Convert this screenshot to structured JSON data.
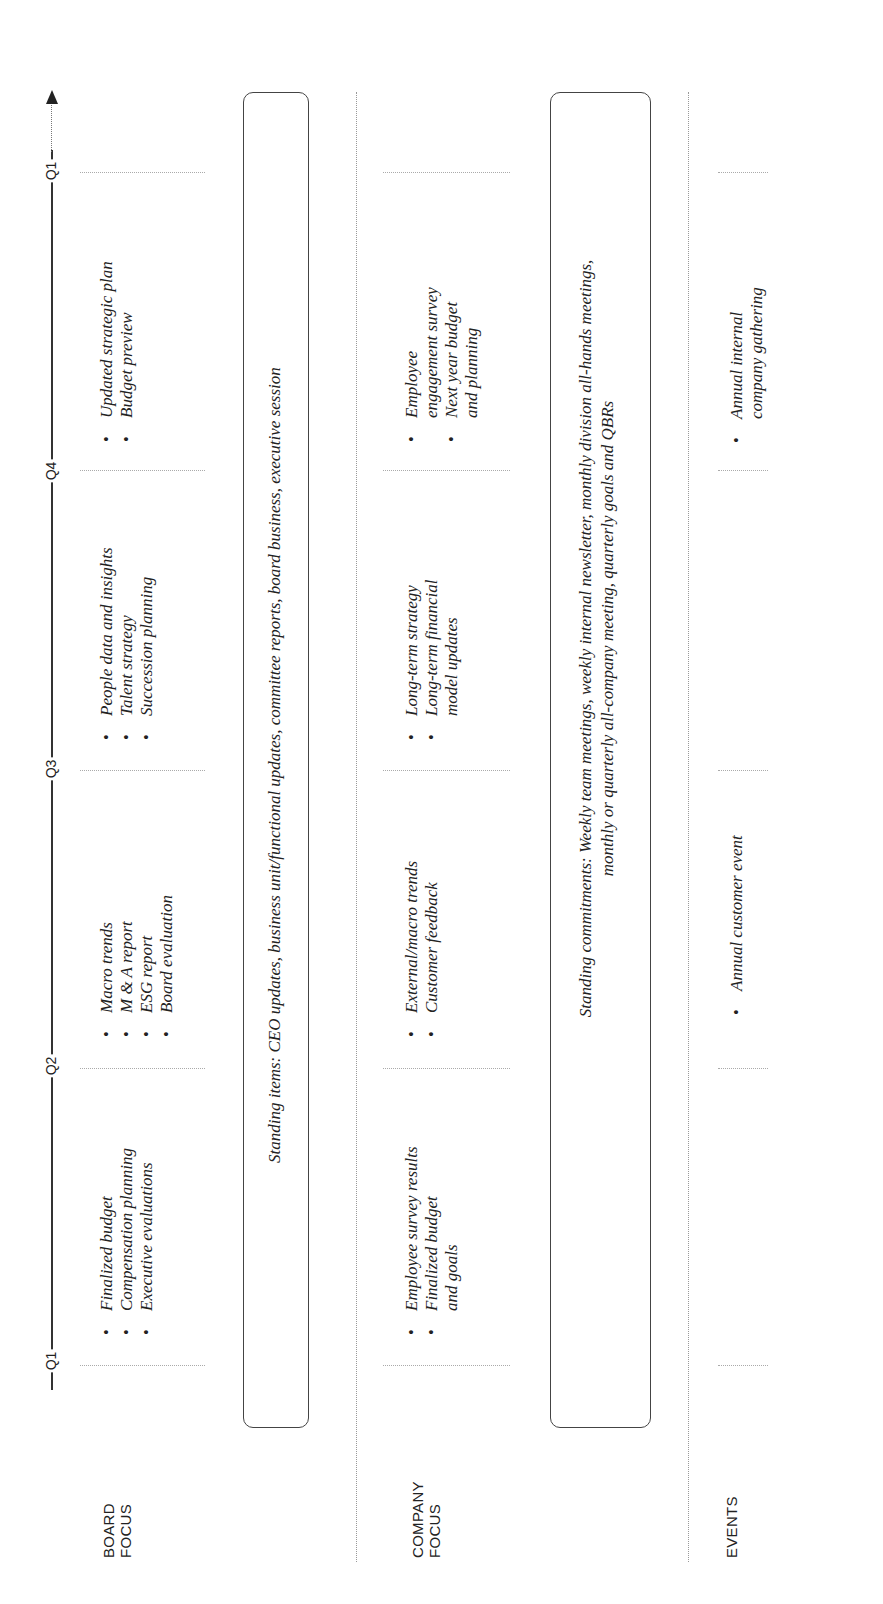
{
  "timeline": {
    "quarters": [
      {
        "label": "Q1",
        "y": 1360
      },
      {
        "label": "Q2",
        "y": 1065
      },
      {
        "label": "Q3",
        "y": 768
      },
      {
        "label": "Q4",
        "y": 470
      },
      {
        "label": "Q1",
        "y": 170
      }
    ],
    "direction": "arrow pointing to later time"
  },
  "rows": {
    "board": {
      "label_line1": "BOARD",
      "label_line2": "FOCUS",
      "q1_items": [
        "Finalized budget",
        "Compensation planning",
        "Executive evaluations"
      ],
      "q2_items": [
        "Macro trends",
        "M & A report",
        "ESG report",
        "Board evaluation"
      ],
      "q3_items": [
        "People data and insights",
        "Talent strategy",
        "Succession planning"
      ],
      "q4_items": [
        "Updated strategic plan",
        "Budget preview"
      ],
      "standing": "Standing items: CEO updates, business unit/functional updates, committee reports, board business, executive session"
    },
    "company": {
      "label_line1": "COMPANY",
      "label_line2": "FOCUS",
      "q1_items": [
        {
          "line1": "Employee survey results",
          "line2": ""
        },
        {
          "line1": "Finalized budget",
          "line2": "and goals"
        }
      ],
      "q2_items": [
        "External/macro trends",
        "Customer feedback"
      ],
      "q3_items": [
        {
          "line1": "Long-term strategy",
          "line2": ""
        },
        {
          "line1": "Long-term financial",
          "line2": "model updates"
        }
      ],
      "q4_items": [
        {
          "line1": "Employee",
          "line2": "engagement survey"
        },
        {
          "line1": "Next year budget",
          "line2": "and planning"
        }
      ],
      "standing_line1": "Standing commitments: Weekly team meetings, weekly internal newsletter, monthly division all-hands meetings,",
      "standing_line2": "monthly or quarterly all-company meeting, quarterly goals and QBRs"
    },
    "events": {
      "label": "EVENTS",
      "q2_items": [
        "Annual customer event"
      ],
      "q4_items": [
        {
          "line1": "Annual internal",
          "line2": "company gathering"
        }
      ]
    }
  },
  "colors": {
    "text": "#222222",
    "axis": "#333333",
    "dotted": "#aaaaaa",
    "box_border": "#444444"
  }
}
